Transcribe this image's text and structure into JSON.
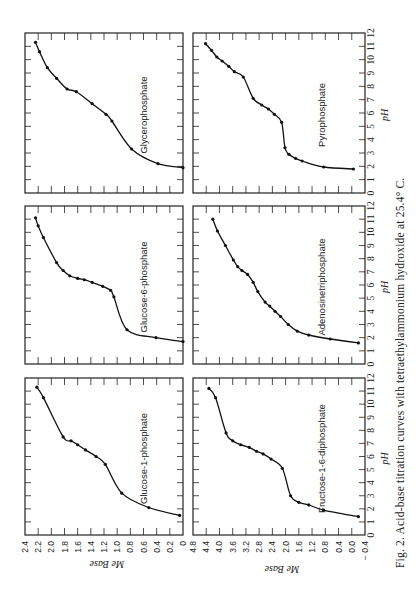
{
  "figure": {
    "caption": "Fig. 2.  Acid-base titration curves with tetraethylammonium hydroxide at 25.4° C.",
    "orientation": "rotated 90 degrees counter-clockwise on page"
  },
  "chart_data": [
    {
      "type": "line",
      "title": "Glucose-1-phosphate",
      "xlabel": "pH",
      "ylabel": "Me Base",
      "xlim": [
        0,
        12
      ],
      "ylim": [
        0,
        2.4
      ],
      "x_ticks": [
        0,
        1,
        2,
        3,
        4,
        5,
        6,
        7,
        8,
        9,
        10,
        11,
        12
      ],
      "y_ticks": [
        0,
        0.2,
        0.4,
        0.6,
        0.8,
        1.0,
        1.2,
        1.4,
        1.6,
        1.8,
        2.0,
        2.2,
        2.4
      ],
      "grid": false,
      "x": [
        1.5,
        2.1,
        3.2,
        5.4,
        6.0,
        6.5,
        6.9,
        7.2,
        7.5,
        10.5,
        11.3
      ],
      "y": [
        0.05,
        0.52,
        0.93,
        1.18,
        1.32,
        1.48,
        1.6,
        1.7,
        1.82,
        2.12,
        2.22
      ]
    },
    {
      "type": "line",
      "title": "Glucose-6-phosphate",
      "xlabel": "pH",
      "ylabel": "Me Base",
      "xlim": [
        0,
        12
      ],
      "ylim": [
        0,
        2.4
      ],
      "x_ticks": [
        0,
        1,
        2,
        3,
        4,
        5,
        6,
        7,
        8,
        9,
        10,
        11,
        12
      ],
      "y_ticks": [
        0,
        0.2,
        0.4,
        0.6,
        0.8,
        1.0,
        1.2,
        1.4,
        1.6,
        1.8,
        2.0,
        2.2,
        2.4
      ],
      "grid": false,
      "x": [
        1.7,
        2.0,
        2.6,
        5.1,
        5.6,
        5.9,
        6.2,
        6.4,
        6.5,
        6.7,
        7.1,
        7.7,
        9.6,
        10.5,
        11.1
      ],
      "y": [
        0.0,
        0.41,
        0.85,
        1.05,
        1.1,
        1.22,
        1.38,
        1.5,
        1.6,
        1.72,
        1.82,
        1.92,
        2.12,
        2.2,
        2.24
      ]
    },
    {
      "type": "line",
      "title": "Glycerophosphate",
      "xlabel": "pH",
      "ylabel": "Me Base",
      "xlim": [
        0,
        12
      ],
      "ylim": [
        0,
        2.4
      ],
      "x_ticks": [
        0,
        1,
        2,
        3,
        4,
        5,
        6,
        7,
        8,
        9,
        10,
        11,
        12
      ],
      "y_ticks": [
        0,
        0.2,
        0.4,
        0.6,
        0.8,
        1.0,
        1.2,
        1.4,
        1.6,
        1.8,
        2.0,
        2.2,
        2.4
      ],
      "grid": false,
      "x": [
        1.9,
        2.2,
        3.3,
        5.4,
        5.9,
        6.7,
        7.6,
        7.8,
        8.6,
        9.4,
        10.6,
        11.3
      ],
      "y": [
        0.0,
        0.38,
        0.78,
        1.08,
        1.17,
        1.38,
        1.62,
        1.76,
        1.92,
        2.06,
        2.18,
        2.24
      ]
    },
    {
      "type": "line",
      "title": "Fructose-1-6-diphosphate",
      "xlabel": "pH",
      "ylabel": "Me Base",
      "xlim": [
        0,
        12
      ],
      "ylim": [
        -0.4,
        4.8
      ],
      "x_ticks": [
        0,
        1,
        2,
        3,
        4,
        5,
        6,
        7,
        8,
        9,
        10,
        11,
        12
      ],
      "y_ticks": [
        -0.4,
        0.0,
        0.4,
        0.8,
        1.2,
        1.6,
        2.0,
        2.4,
        2.8,
        3.2,
        3.6,
        4.0,
        4.4,
        4.8
      ],
      "grid": false,
      "x": [
        1.4,
        1.9,
        2.3,
        2.5,
        3.0,
        5.1,
        5.8,
        6.2,
        6.4,
        6.7,
        6.9,
        7.2,
        7.8,
        10.5,
        11.2
      ],
      "y": [
        -0.2,
        0.85,
        1.3,
        1.6,
        1.85,
        2.1,
        2.44,
        2.68,
        2.88,
        3.1,
        3.36,
        3.6,
        3.8,
        4.12,
        4.32
      ]
    },
    {
      "type": "line",
      "title": "Adenosinetriphosphate",
      "xlabel": "pH",
      "ylabel": "Me Base",
      "xlim": [
        0,
        12
      ],
      "ylim": [
        -0.4,
        4.8
      ],
      "x_ticks": [
        0,
        1,
        2,
        3,
        4,
        5,
        6,
        7,
        8,
        9,
        10,
        11,
        12
      ],
      "y_ticks": [
        -0.4,
        0.0,
        0.4,
        0.8,
        1.2,
        1.6,
        2.0,
        2.4,
        2.8,
        3.2,
        3.6,
        4.0,
        4.4,
        4.8
      ],
      "grid": false,
      "x": [
        1.6,
        1.9,
        2.2,
        2.5,
        3.0,
        3.6,
        4.0,
        4.4,
        4.7,
        5.5,
        6.2,
        6.8,
        7.1,
        7.4,
        7.9,
        9.0,
        10.1,
        11.0
      ],
      "y": [
        -0.2,
        0.65,
        1.3,
        1.65,
        1.92,
        2.15,
        2.32,
        2.48,
        2.62,
        2.84,
        2.98,
        3.15,
        3.32,
        3.45,
        3.58,
        3.82,
        4.06,
        4.2
      ]
    },
    {
      "type": "line",
      "title": "Pyrophosphate",
      "xlabel": "pH",
      "ylabel": "Me Base",
      "xlim": [
        0,
        12
      ],
      "ylim": [
        -0.4,
        4.8
      ],
      "x_ticks": [
        0,
        1,
        2,
        3,
        4,
        5,
        6,
        7,
        8,
        9,
        10,
        11,
        12
      ],
      "y_ticks": [
        -0.4,
        0.0,
        0.4,
        0.8,
        1.2,
        1.6,
        2.0,
        2.4,
        2.8,
        3.2,
        3.6,
        4.0,
        4.4,
        4.8
      ],
      "grid": false,
      "x": [
        1.8,
        1.95,
        2.4,
        2.6,
        2.9,
        3.4,
        5.3,
        5.9,
        6.3,
        6.6,
        7.1,
        8.7,
        9.1,
        9.5,
        9.9,
        10.2,
        10.7,
        11.2
      ],
      "y": [
        -0.05,
        0.85,
        1.5,
        1.7,
        1.9,
        2.02,
        2.12,
        2.34,
        2.52,
        2.72,
        2.98,
        3.28,
        3.55,
        3.72,
        3.92,
        4.08,
        4.24,
        4.42
      ]
    }
  ],
  "axes_labels": {
    "ph": "pH",
    "me_base": "Me Base"
  }
}
